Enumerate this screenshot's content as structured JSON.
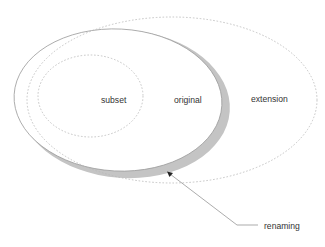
{
  "diagram": {
    "type": "set-relationship",
    "regions": {
      "subset": {
        "label": "subset",
        "style": "dashed"
      },
      "original": {
        "label": "original",
        "style": "solid"
      },
      "extension": {
        "label": "extension",
        "style": "dashed"
      }
    },
    "annotation": {
      "label": "renaming",
      "points_to": "shaded crescent between original and its renamed copy"
    },
    "colors": {
      "outline": "#9a9a9a",
      "dashed": "#b8b8b8",
      "shade": "#c4c4c4",
      "text": "#333333",
      "arrow": "#888888"
    }
  }
}
